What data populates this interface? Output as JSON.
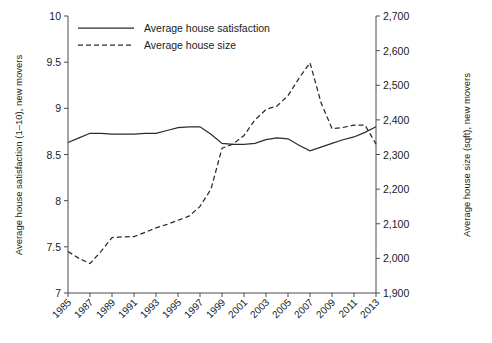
{
  "chart_data": {
    "type": "line",
    "title": "",
    "xlabel": "",
    "ylabel": "Average house satisfaction (1–10), new movers",
    "y2label": "Average house size (sqft), new movers",
    "grid": false,
    "legend_position": "top-left-inside",
    "xlim": [
      1985,
      2013
    ],
    "ylim": [
      7,
      10
    ],
    "y2lim": [
      1900,
      2700
    ],
    "xticks": [
      "1985",
      "1987",
      "1989",
      "1991",
      "1993",
      "1995",
      "1997",
      "1999",
      "2001",
      "2003",
      "2005",
      "2007",
      "2009",
      "2011",
      "2013"
    ],
    "xtick_values": [
      1985,
      1987,
      1989,
      1991,
      1993,
      1995,
      1997,
      1999,
      2001,
      2003,
      2005,
      2007,
      2009,
      2011,
      2013
    ],
    "yticks": [
      "7",
      "7.5",
      "8",
      "8.5",
      "9",
      "9.5",
      "10"
    ],
    "ytick_values": [
      7,
      7.5,
      8,
      8.5,
      9,
      9.5,
      10
    ],
    "y2ticks": [
      "1,900",
      "2,000",
      "2,100",
      "2,200",
      "2,300",
      "2,400",
      "2,500",
      "2,600",
      "2,700"
    ],
    "y2tick_values": [
      1900,
      2000,
      2100,
      2200,
      2300,
      2400,
      2500,
      2600,
      2700
    ],
    "x": [
      1985,
      1986,
      1987,
      1988,
      1989,
      1990,
      1991,
      1992,
      1993,
      1994,
      1995,
      1996,
      1997,
      1998,
      1999,
      2000,
      2001,
      2002,
      2003,
      2004,
      2005,
      2006,
      2007,
      2008,
      2009,
      2010,
      2011,
      2012,
      2013
    ],
    "series": [
      {
        "name": "Average house satisfaction",
        "style": "solid",
        "axis": "left",
        "color": "#2b2b2b",
        "values": [
          8.63,
          8.68,
          8.73,
          8.73,
          8.72,
          8.72,
          8.72,
          8.73,
          8.73,
          8.76,
          8.79,
          8.8,
          8.8,
          8.72,
          8.62,
          8.61,
          8.61,
          8.62,
          8.66,
          8.68,
          8.67,
          8.6,
          8.54,
          8.58,
          8.62,
          8.66,
          8.69,
          8.74,
          8.8
        ]
      },
      {
        "name": "Average house size",
        "style": "dashed",
        "axis": "right",
        "color": "#2b2b2b",
        "values": [
          2020,
          2000,
          1985,
          2020,
          2060,
          2062,
          2063,
          2075,
          2088,
          2098,
          2110,
          2122,
          2150,
          2200,
          2318,
          2330,
          2355,
          2400,
          2430,
          2440,
          2470,
          2520,
          2565,
          2450,
          2375,
          2378,
          2385,
          2385,
          2330
        ]
      }
    ],
    "legend": [
      "Average house satisfaction",
      "Average house size"
    ]
  }
}
